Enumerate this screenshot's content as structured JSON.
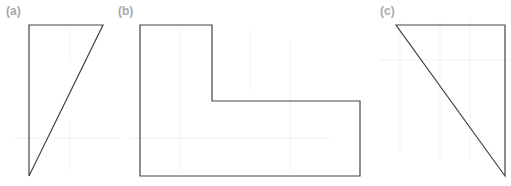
{
  "figures": [
    {
      "label": "(a)",
      "shape": "right-triangle",
      "points": "29,25 103,25 29,176"
    },
    {
      "label": "(b)",
      "shape": "L-shape",
      "points": "140,25 212,25 212,101 360,101 360,176 140,176"
    },
    {
      "label": "(c)",
      "shape": "right-triangle",
      "points": "396,25 505,25 505,176"
    }
  ],
  "colors": {
    "stroke": "#444444",
    "label": "#a8a8a8"
  }
}
